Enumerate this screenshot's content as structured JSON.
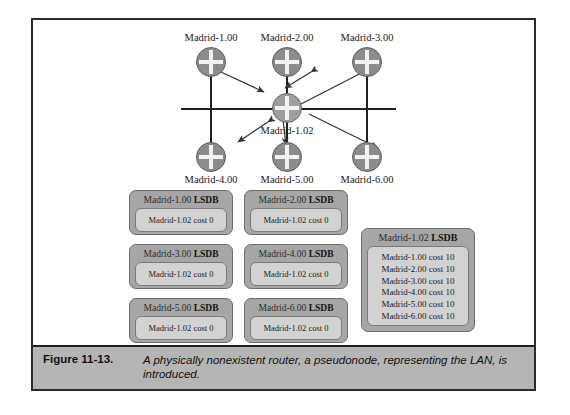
{
  "figure": {
    "number": "Figure 11-13.",
    "caption": "A physically nonexistent router, a pseudonode, representing the LAN, is introduced."
  },
  "topology": {
    "pseudonode": {
      "label": "Madrid-1.02",
      "icon": "router-icon"
    },
    "routers_top": [
      {
        "label": "Madrid-1.00",
        "icon": "router-icon"
      },
      {
        "label": "Madrid-2.00",
        "icon": "router-icon"
      },
      {
        "label": "Madrid-3.00",
        "icon": "router-icon"
      }
    ],
    "routers_bottom": [
      {
        "label": "Madrid-4.00",
        "icon": "router-icon"
      },
      {
        "label": "Madrid-5.00",
        "icon": "router-icon"
      },
      {
        "label": "Madrid-6.00",
        "icon": "router-icon"
      }
    ]
  },
  "lsdbs": [
    {
      "owner": "Madrid-1.00",
      "suffix": "LSDB",
      "entries": [
        "Madrid-1.02 cost 0"
      ]
    },
    {
      "owner": "Madrid-2.00",
      "suffix": "LSDB",
      "entries": [
        "Madrid-1.02 cost 0"
      ]
    },
    {
      "owner": "Madrid-3.00",
      "suffix": "LSDB",
      "entries": [
        "Madrid-1.02 cost 0"
      ]
    },
    {
      "owner": "Madrid-4.00",
      "suffix": "LSDB",
      "entries": [
        "Madrid-1.02 cost 0"
      ]
    },
    {
      "owner": "Madrid-5.00",
      "suffix": "LSDB",
      "entries": [
        "Madrid-1.02 cost 0"
      ]
    },
    {
      "owner": "Madrid-6.00",
      "suffix": "LSDB",
      "entries": [
        "Madrid-1.02 cost 0"
      ]
    }
  ],
  "lsdb_pseudonode": {
    "owner": "Madrid-1.02",
    "suffix": "LSDB",
    "entries": [
      "Madrid-1.00 cost 10",
      "Madrid-2.00 cost 10",
      "Madrid-3.00 cost 10",
      "Madrid-4.00 cost 10",
      "Madrid-5.00 cost 10",
      "Madrid-6.00 cost 10"
    ]
  },
  "colors": {
    "node_fill": "#8c8c8c",
    "lsdb_fill": "#a6a6a6",
    "lsdb_inner_fill": "#d2d2d2",
    "caption_bar": "#b5b5b5",
    "line": "#1f1f1f"
  }
}
